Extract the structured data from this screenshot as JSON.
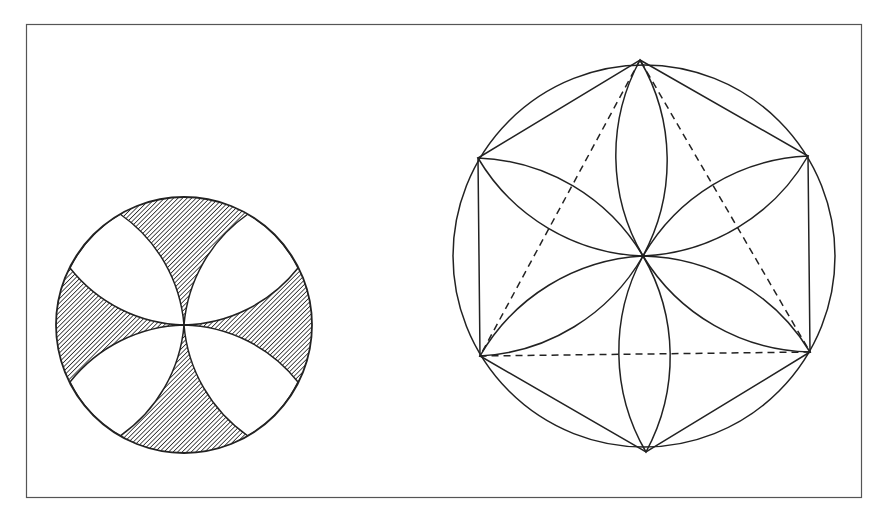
{
  "figure": {
    "stroke_color": "#222222",
    "frame_color": "#555555",
    "hatch_color": "#333333",
    "left_figure": {
      "name": "hatched cross rosette",
      "shaded_regions": 4,
      "white_petals": 4
    },
    "right_figure": {
      "name": "six-petal rosette in hexagon with inscribed dashed triangle",
      "petals": 6,
      "hexagon_vertices": 6,
      "dashed_triangle": true
    }
  }
}
